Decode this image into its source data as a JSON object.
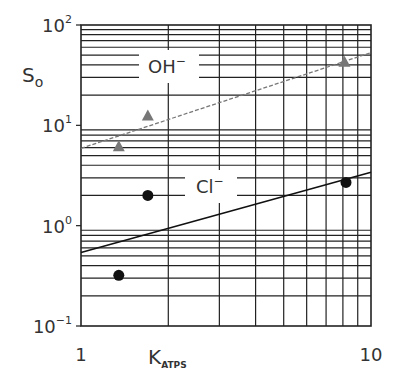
{
  "chart_data": {
    "type": "scatter",
    "title": "",
    "xlabel": "K",
    "xlabel_subscript": "ATPS",
    "ylabel": "S",
    "ylabel_subscript": "o",
    "xscale": "log",
    "yscale": "log",
    "xlim": [
      1,
      10
    ],
    "ylim": [
      0.1,
      100
    ],
    "grid": true,
    "x_ticks": [
      {
        "value": 1,
        "label": "1"
      },
      {
        "value": 10,
        "label": "10"
      }
    ],
    "y_ticks": [
      {
        "value": 0.1,
        "base": "10",
        "exp": "−1"
      },
      {
        "value": 1,
        "base": "10",
        "exp": "0"
      },
      {
        "value": 10,
        "base": "10",
        "exp": "1"
      },
      {
        "value": 100,
        "base": "10",
        "exp": "2"
      }
    ],
    "series": [
      {
        "name": "OH⁻",
        "label_base": "OH",
        "label_sup": "−",
        "marker": "triangle",
        "color": "#777777",
        "points": [
          {
            "x": 1.35,
            "y": 6.2
          },
          {
            "x": 1.7,
            "y": 12.5
          },
          {
            "x": 8.1,
            "y": 43
          }
        ],
        "fit_line": {
          "style": "dashed",
          "x": [
            1,
            10
          ],
          "y": [
            5.9,
            53
          ]
        }
      },
      {
        "name": "Cl⁻",
        "label_base": "Cl",
        "label_sup": "−",
        "marker": "circle",
        "color": "#111111",
        "points": [
          {
            "x": 1.35,
            "y": 0.32
          },
          {
            "x": 1.7,
            "y": 2.0
          },
          {
            "x": 8.2,
            "y": 2.7
          }
        ],
        "fit_line": {
          "style": "solid",
          "x": [
            1,
            10
          ],
          "y": [
            0.54,
            3.4
          ]
        }
      }
    ]
  }
}
